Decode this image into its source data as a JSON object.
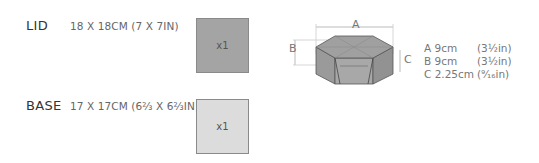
{
  "parts": [
    {
      "label": "LID",
      "size": "18 X 18CM (7 X 7IN)",
      "quantity": "x1",
      "swatch_color": "#a4a4a4"
    },
    {
      "label": "BASE",
      "size": "17 X 17CM (6⅔ X 6⅔IN)",
      "quantity": "x1",
      "swatch_color": "#dcdcdc"
    }
  ],
  "diagram": {
    "labels": {
      "a": "A",
      "b": "B",
      "c": "C"
    }
  },
  "dimensions": [
    {
      "key": "A",
      "metric": "A 9cm",
      "imperial": "(3½in)"
    },
    {
      "key": "B",
      "metric": "B 9cm",
      "imperial": "(3½in)"
    },
    {
      "key": "C",
      "metric": "C 2.25cm",
      "imperial": "(⁹⁄₁₆in)"
    }
  ]
}
